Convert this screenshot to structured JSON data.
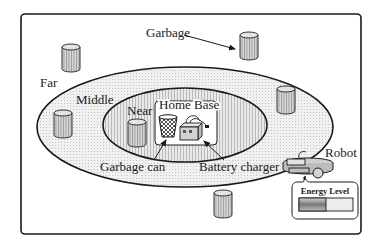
{
  "diagram": {
    "zones": {
      "far": "Far",
      "middle": "Middle",
      "near": "Near",
      "home_base": "Home Base"
    },
    "labels": {
      "garbage": "Garbage",
      "garbage_can": "Garbage can",
      "battery_charger": "Battery charger",
      "robot": "Robot",
      "energy_level": "Energy Level"
    },
    "energy_level_fraction": 0.5,
    "colors": {
      "stroke": "#1a1a1a",
      "middle_fill": "#ededed",
      "near_fill": "#dedede",
      "can_fill": "#c8c8c8",
      "background": "#ffffff"
    }
  }
}
